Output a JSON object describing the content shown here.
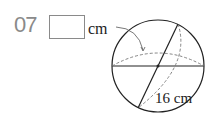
{
  "problem": {
    "number": "07",
    "answer_box_value": "",
    "answer_unit": "cm",
    "diameter_label": "16 cm"
  },
  "figure": {
    "shape": "sphere",
    "diameter": 16,
    "unit": "cm"
  }
}
